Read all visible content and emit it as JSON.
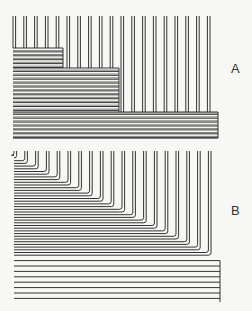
{
  "figure": {
    "panels": [
      {
        "id": "A",
        "label": "A",
        "description": "Parallel vertical wire pairs terminating into stepped blocks of horizontal lines (three tiers)",
        "vertical_pairs": {
          "x_start": 13,
          "pitch": 10.8,
          "count": 19,
          "pair_gap": 2.6,
          "top": 16
        },
        "tiers": [
          {
            "x_end": 63,
            "top": 48
          },
          {
            "x_end": 119,
            "top": 68
          },
          {
            "x_end": 218,
            "top": 112
          }
        ],
        "horizontal_block": {
          "x_start": 13,
          "bottom": 138,
          "line_pitch": 3.9
        }
      },
      {
        "id": "B",
        "label": "B",
        "description": "Vertical wire pairs each bending into horizontal lines forming a diagonal staircase of nested U-turn loops",
        "vertical_pairs": {
          "x_start": 14,
          "pitch": 10.8,
          "count": 19,
          "pair_gap": 2.6,
          "top": 151
        },
        "staircase": {
          "first_y": 158,
          "step_y": 5.4
        },
        "horizontal_block": {
          "x_start": 14,
          "x_end": 220,
          "bottom": 302,
          "line_pitch": 5.4
        }
      }
    ]
  },
  "colors": {
    "stroke": "#333333",
    "background": "#f7f7f5"
  }
}
